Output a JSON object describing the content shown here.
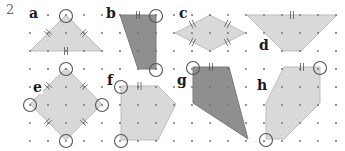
{
  "question": {
    "number": "2"
  },
  "colors": {
    "light_fill": "#d9d9d9",
    "dark_fill": "#8f8f8f",
    "dot": "#777777",
    "circle": "#555555",
    "mark": "#555555"
  },
  "grid": {
    "origin_x": 30,
    "origin_y": 15,
    "spacing": 18,
    "cols": 18,
    "rows": 8
  },
  "shapes": [
    {
      "label": "a",
      "label_x": 28,
      "label_y": 6,
      "fill": "light",
      "type": "isosceles triangle",
      "points": [
        [
          66,
          15
        ],
        [
          102,
          51
        ],
        [
          30,
          51
        ]
      ],
      "circled": [
        [
          66,
          15
        ]
      ],
      "marks": [
        [
          [
            48,
            33
          ],
          [
            30,
            51
          ]
        ],
        [
          [
            84,
            33
          ],
          [
            102,
            51
          ]
        ]
      ]
    },
    {
      "label": "b",
      "label_x": 105,
      "label_y": 6,
      "fill": "dark",
      "type": "quadrilateral",
      "points": [
        [
          120,
          15
        ],
        [
          156,
          15
        ],
        [
          156,
          69
        ],
        [
          138,
          69
        ]
      ],
      "circled": [
        [
          156,
          15
        ],
        [
          156,
          69
        ]
      ]
    },
    {
      "label": "c",
      "label_x": 178,
      "label_y": 6,
      "fill": "light",
      "type": "rhombus",
      "points": [
        [
          175,
          33
        ],
        [
          210,
          15
        ],
        [
          245,
          33
        ],
        [
          210,
          51
        ]
      ],
      "circled": []
    },
    {
      "label": "d",
      "label_x": 258,
      "label_y": 38,
      "fill": "light",
      "type": "isosceles trapezium",
      "points": [
        [
          247,
          15
        ],
        [
          337,
          15
        ],
        [
          301,
          51
        ],
        [
          283,
          51
        ]
      ],
      "circled": []
    },
    {
      "label": "e",
      "label_x": 32,
      "label_y": 80,
      "fill": "light",
      "type": "square",
      "points": [
        [
          66,
          68
        ],
        [
          102,
          104
        ],
        [
          66,
          140
        ],
        [
          30,
          104
        ]
      ],
      "circled": [
        [
          66,
          68
        ],
        [
          102,
          104
        ],
        [
          66,
          140
        ],
        [
          30,
          104
        ]
      ]
    },
    {
      "label": "f",
      "label_x": 106,
      "label_y": 73,
      "fill": "light",
      "type": "pentagon",
      "points": [
        [
          121,
          86
        ],
        [
          158,
          86
        ],
        [
          176,
          104
        ],
        [
          158,
          140
        ],
        [
          121,
          140
        ]
      ],
      "circled": [
        [
          121,
          86
        ],
        [
          121,
          140
        ]
      ]
    },
    {
      "label": "g",
      "label_x": 176,
      "label_y": 73,
      "fill": "dark",
      "type": "kite",
      "points": [
        [
          193,
          67
        ],
        [
          229,
          67
        ],
        [
          248,
          139
        ],
        [
          193,
          103
        ]
      ],
      "circled": [
        [
          193,
          67
        ]
      ]
    },
    {
      "label": "h",
      "label_x": 256,
      "label_y": 78,
      "fill": "light",
      "type": "hexagon",
      "points": [
        [
          284,
          67
        ],
        [
          320,
          67
        ],
        [
          320,
          103
        ],
        [
          284,
          139
        ],
        [
          266,
          139
        ],
        [
          266,
          103
        ]
      ],
      "circled": [
        [
          320,
          67
        ],
        [
          266,
          139
        ]
      ]
    }
  ]
}
